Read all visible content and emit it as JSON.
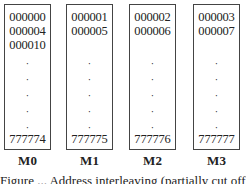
{
  "banks": [
    {
      "label": "M0",
      "top": [
        "000000",
        "000004",
        "000010"
      ],
      "bottom": "777774"
    },
    {
      "label": "M1",
      "top": [
        "000001",
        "000005"
      ],
      "bottom": "777775"
    },
    {
      "label": "M2",
      "top": [
        "000002",
        "000006"
      ],
      "bottom": "777776"
    },
    {
      "label": "M3",
      "top": [
        "000003",
        "000007"
      ],
      "bottom": "777777"
    }
  ],
  "ellipsis": "·",
  "caption": "Figure ... Address interleaving (partially cut off)"
}
